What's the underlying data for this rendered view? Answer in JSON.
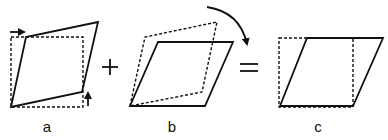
{
  "figure": {
    "panels": [
      {
        "id": "a",
        "label": "a",
        "description": "square sheared by a pair of shear forces (pure shear, asymmetric)",
        "dashed_square": [
          [
            11,
            37
          ],
          [
            83,
            37
          ],
          [
            83,
            107
          ],
          [
            11,
            107
          ]
        ],
        "solid_shape": [
          [
            11,
            107
          ],
          [
            26,
            37
          ],
          [
            98,
            22
          ],
          [
            82,
            92
          ]
        ],
        "arrows": [
          "right-arrow-top-left",
          "up-arrow-bottom-right"
        ]
      },
      {
        "id": "b",
        "label": "b",
        "description": "rigid rotation clockwise",
        "dashed_shape": [
          [
            130,
            106
          ],
          [
            145,
            37
          ],
          [
            217,
            22
          ],
          [
            202,
            92
          ]
        ],
        "solid_shape": [
          [
            130,
            106
          ],
          [
            158,
            42
          ],
          [
            233,
            42
          ],
          [
            205,
            106
          ]
        ],
        "arrows": [
          "curved-clockwise-arrow"
        ]
      },
      {
        "id": "c",
        "label": "c",
        "description": "resulting simple shear",
        "dashed_square": [
          [
            279,
            38
          ],
          [
            353,
            38
          ],
          [
            353,
            107
          ],
          [
            279,
            107
          ]
        ],
        "solid_shape": [
          [
            280,
            106
          ],
          [
            307,
            38
          ],
          [
            383,
            38
          ],
          [
            353,
            106
          ]
        ]
      }
    ],
    "operators": {
      "plus": "+",
      "equals": "="
    },
    "colors": {
      "stroke": "#111111",
      "background": "#ffffff"
    }
  }
}
